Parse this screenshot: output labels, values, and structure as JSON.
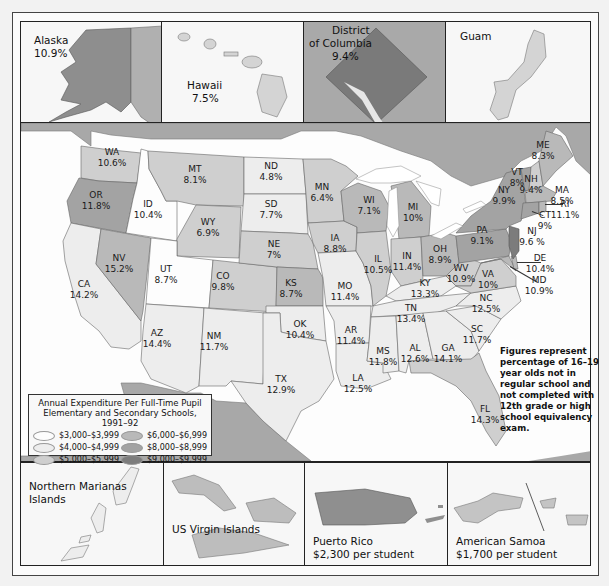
{
  "colors": {
    "tier_3000_3999": "#fdfdfd",
    "tier_4000_4999": "#ededed",
    "tier_5000_5999": "#cfcfcf",
    "tier_6000_6999": "#b9b9b9",
    "tier_8000_8999": "#a3a3a3",
    "tier_9000_9999": "#7c7c7c",
    "neighbors": "#a8a8a8",
    "water": "#ffffff"
  },
  "insets_top": {
    "alaska": {
      "name": "Alaska",
      "value": "10.9%"
    },
    "hawaii": {
      "name": "Hawaii",
      "value": "7.5%"
    },
    "dc": {
      "name_line1": "District",
      "name_line2": "of Columbia",
      "value": "9.4%"
    },
    "guam": {
      "name": "Guam"
    }
  },
  "insets_bottom": {
    "marianas": {
      "name_line1": "Northern Marianas",
      "name_line2": "Islands"
    },
    "virgin_islands": {
      "name": "US Virgin Islands"
    },
    "puerto_rico": {
      "name": "Puerto Rico",
      "spend": "$2,300 per student"
    },
    "american_samoa": {
      "name": "American Samoa",
      "spend": "$1,700 per student"
    }
  },
  "states": [
    {
      "abbr": "WA",
      "value": "10.6%",
      "x": 112,
      "y": 153,
      "tier": "tier_5000_5999"
    },
    {
      "abbr": "OR",
      "value": "11.8%",
      "x": 96,
      "y": 196,
      "tier": "tier_8000_8999"
    },
    {
      "abbr": "ID",
      "value": "10.4%",
      "x": 148,
      "y": 205,
      "tier": "tier_3000_3999"
    },
    {
      "abbr": "MT",
      "value": "8.1%",
      "x": 195,
      "y": 170,
      "tier": "tier_5000_5999"
    },
    {
      "abbr": "ND",
      "value": "4.8%",
      "x": 271,
      "y": 167,
      "tier": "tier_4000_4999"
    },
    {
      "abbr": "SD",
      "value": "7.7%",
      "x": 271,
      "y": 205,
      "tier": "tier_4000_4999"
    },
    {
      "abbr": "WY",
      "value": "6.9%",
      "x": 208,
      "y": 223,
      "tier": "tier_5000_5999"
    },
    {
      "abbr": "NE",
      "value": "7%",
      "x": 274,
      "y": 245,
      "tier": "tier_5000_5999"
    },
    {
      "abbr": "NV",
      "value": "15.2%",
      "x": 119,
      "y": 259,
      "tier": "tier_6000_6999"
    },
    {
      "abbr": "UT",
      "value": "8.7%",
      "x": 166,
      "y": 270,
      "tier": "tier_3000_3999"
    },
    {
      "abbr": "CO",
      "value": "9.8%",
      "x": 223,
      "y": 277,
      "tier": "tier_6000_6999"
    },
    {
      "abbr": "KS",
      "value": "8.7%",
      "x": 291,
      "y": 284,
      "tier": "tier_6000_6999"
    },
    {
      "abbr": "CA",
      "value": "14.2%",
      "x": 84,
      "y": 285,
      "tier": "tier_4000_4999"
    },
    {
      "abbr": "AZ",
      "value": "14.4%",
      "x": 157,
      "y": 334,
      "tier": "tier_4000_4999"
    },
    {
      "abbr": "NM",
      "value": "11.7%",
      "x": 214,
      "y": 337,
      "tier": "tier_4000_4999"
    },
    {
      "abbr": "OK",
      "value": "10.4%",
      "x": 300,
      "y": 325,
      "tier": "tier_4000_4999"
    },
    {
      "abbr": "TX",
      "value": "12.9%",
      "x": 281,
      "y": 380,
      "tier": "tier_4000_4999"
    },
    {
      "abbr": "MN",
      "value": "6.4%",
      "x": 322,
      "y": 188,
      "tier": "tier_5000_5999"
    },
    {
      "abbr": "IA",
      "value": "8.8%",
      "x": 335,
      "y": 239,
      "tier": "tier_5000_5999"
    },
    {
      "abbr": "MO",
      "value": "11.4%",
      "x": 345,
      "y": 287,
      "tier": "tier_4000_4999"
    },
    {
      "abbr": "AR",
      "value": "11.4%",
      "x": 351,
      "y": 331,
      "tier": "tier_4000_4999"
    },
    {
      "abbr": "LA",
      "value": "12.5%",
      "x": 358,
      "y": 379,
      "tier": "tier_4000_4999"
    },
    {
      "abbr": "WI",
      "value": "7.1%",
      "x": 369,
      "y": 201,
      "tier": "tier_6000_6999"
    },
    {
      "abbr": "IL",
      "value": "10.5%",
      "x": 378,
      "y": 260,
      "tier": "tier_5000_5999"
    },
    {
      "abbr": "MI",
      "value": "10%",
      "x": 413,
      "y": 208,
      "tier": "tier_6000_6999"
    },
    {
      "abbr": "IN",
      "value": "11.4%",
      "x": 407,
      "y": 257,
      "tier": "tier_5000_5999"
    },
    {
      "abbr": "OH",
      "value": "8.9%",
      "x": 440,
      "y": 250,
      "tier": "tier_6000_6999"
    },
    {
      "abbr": "KY",
      "value": "13.3%",
      "x": 425,
      "y": 284,
      "tier": "tier_4000_4999"
    },
    {
      "abbr": "TN",
      "value": "13.4%",
      "x": 411,
      "y": 309,
      "tier": "tier_4000_4999"
    },
    {
      "abbr": "MS",
      "value": "11.8%",
      "x": 383,
      "y": 352,
      "tier": "tier_4000_4999"
    },
    {
      "abbr": "AL",
      "value": "12.6%",
      "x": 415,
      "y": 349,
      "tier": "tier_4000_4999"
    },
    {
      "abbr": "GA",
      "value": "14.1%",
      "x": 448,
      "y": 349,
      "tier": "tier_4000_4999"
    },
    {
      "abbr": "FL",
      "value": "14.3%",
      "x": 485,
      "y": 410,
      "tier": "tier_5000_5999"
    },
    {
      "abbr": "SC",
      "value": "11.7%",
      "x": 477,
      "y": 330,
      "tier": "tier_4000_4999"
    },
    {
      "abbr": "NC",
      "value": "12.5%",
      "x": 486,
      "y": 299,
      "tier": "tier_4000_4999"
    },
    {
      "abbr": "WV",
      "value": "10.9%",
      "x": 461,
      "y": 269,
      "tier": "tier_5000_5999"
    },
    {
      "abbr": "VA",
      "value": "10%",
      "x": 488,
      "y": 275,
      "tier": "tier_5000_5999"
    },
    {
      "abbr": "PA",
      "value": "9.1%",
      "x": 482,
      "y": 231,
      "tier": "tier_8000_8999"
    },
    {
      "abbr": "NY",
      "value": "9.9%",
      "x": 504,
      "y": 191,
      "tier": "tier_8000_8999"
    },
    {
      "abbr": "VT",
      "value": "8%",
      "x": 517,
      "y": 173,
      "tier": "tier_8000_8999"
    },
    {
      "abbr": "NH",
      "value": "9.4%",
      "x": 531,
      "y": 180,
      "tier": "tier_5000_5999"
    },
    {
      "abbr": "ME",
      "value": "8.3%",
      "x": 543,
      "y": 146,
      "tier": "tier_6000_6999"
    },
    {
      "abbr": "MA",
      "value": "8.5%",
      "x": 562,
      "y": 191,
      "tier": "tier_6000_6999"
    },
    {
      "abbr": "RI",
      "value": "11.1%",
      "x": 565,
      "y": 205,
      "tier": "tier_6000_6999"
    },
    {
      "abbr": "CT",
      "value": "9%",
      "x": 545,
      "y": 216,
      "tier": "tier_8000_8999"
    },
    {
      "abbr": "NJ",
      "value": "9.6 %",
      "x": 532,
      "y": 232,
      "tier": "tier_9000_9999"
    },
    {
      "abbr": "DE",
      "value": "10.4%",
      "x": 540,
      "y": 259,
      "tier": "tier_6000_6999"
    },
    {
      "abbr": "MD",
      "value": "10.9%",
      "x": 539,
      "y": 281,
      "tier": "tier_6000_6999"
    }
  ],
  "legend": {
    "title_line1": "Annual Expenditure Per Full-Time Pupil",
    "title_line2": "Elementary and Secondary Schools, 1991–92",
    "items": [
      {
        "label": "$3,000–$3,999",
        "tier": "tier_3000_3999"
      },
      {
        "label": "$6,000–$6,999",
        "tier": "tier_6000_6999"
      },
      {
        "label": "$4,000–$4,999",
        "tier": "tier_4000_4999"
      },
      {
        "label": "$8,000–$8,999",
        "tier": "tier_8000_8999"
      },
      {
        "label": "$5,000–$5,999",
        "tier": "tier_5000_5999"
      },
      {
        "label": "$9,000–$9,999",
        "tier": "tier_9000_9999"
      }
    ]
  },
  "note": "Figures represent percentage of 16–19 year olds not in regular school and not completed with 12th grade or high school equivalency exam."
}
